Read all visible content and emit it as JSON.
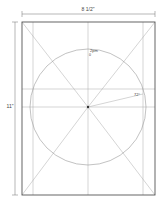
{
  "diagram": {
    "width_label": "8 1/2\"",
    "height_label": "11\"",
    "circle_top_label": "2pm",
    "circle_top_sublabel": "0",
    "angle_label": "72°",
    "colors": {
      "frame": "#555555",
      "guides": "#aaaaaa",
      "circle": "#999999",
      "dimension": "#888888",
      "center_dot": "#333333"
    }
  }
}
